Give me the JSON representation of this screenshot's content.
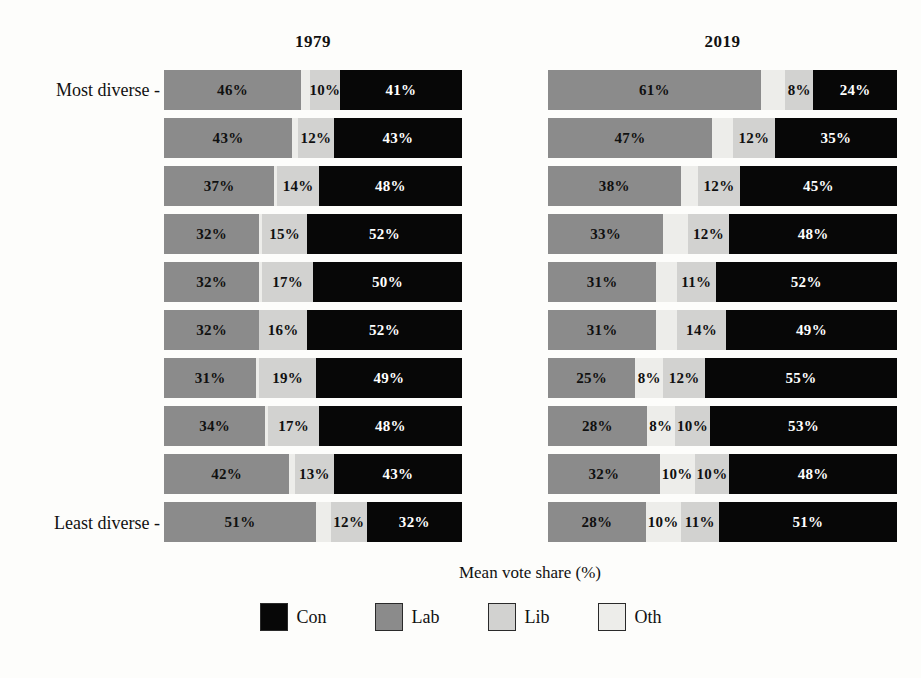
{
  "axis": {
    "xlabel": "Mean vote share (%)",
    "ytick_top": "Most diverse -",
    "ytick_bottom": "Least diverse -"
  },
  "panels": [
    {
      "title": "1979"
    },
    {
      "title": "2019"
    }
  ],
  "legend": {
    "items": [
      {
        "label": "Con",
        "color": "#070707"
      },
      {
        "label": "Lab",
        "color": "#8b8b8b"
      },
      {
        "label": "Lib",
        "color": "#d2d2d0"
      },
      {
        "label": "Oth",
        "color": "#ededea"
      }
    ]
  },
  "chart_data": {
    "type": "bar",
    "title": "",
    "subtitle": "",
    "orientation": "horizontal",
    "stacked": true,
    "xlabel": "Mean vote share (%)",
    "ylabel": "",
    "xlim": [
      0,
      100
    ],
    "grid": false,
    "legend_position": "bottom",
    "categories": [
      "Most diverse",
      "2",
      "3",
      "4",
      "5",
      "6",
      "7",
      "8",
      "9",
      "Least diverse"
    ],
    "segment_order": [
      "Lab",
      "Oth",
      "Lib",
      "Con"
    ],
    "panels": [
      {
        "name": "1979",
        "rows": [
          {
            "Lab": 46,
            "Oth": 3,
            "Lib": 10,
            "Con": 41,
            "labels": {
              "Lab": "46%",
              "Oth": "",
              "Lib": "10%",
              "Con": "41%"
            }
          },
          {
            "Lab": 43,
            "Oth": 2,
            "Lib": 12,
            "Con": 43,
            "labels": {
              "Lab": "43%",
              "Oth": "",
              "Lib": "12%",
              "Con": "43%"
            }
          },
          {
            "Lab": 37,
            "Oth": 1,
            "Lib": 14,
            "Con": 48,
            "labels": {
              "Lab": "37%",
              "Oth": "",
              "Lib": "14%",
              "Con": "48%"
            }
          },
          {
            "Lab": 32,
            "Oth": 1,
            "Lib": 15,
            "Con": 52,
            "labels": {
              "Lab": "32%",
              "Oth": "",
              "Lib": "15%",
              "Con": "52%"
            }
          },
          {
            "Lab": 32,
            "Oth": 1,
            "Lib": 17,
            "Con": 50,
            "labels": {
              "Lab": "32%",
              "Oth": "",
              "Lib": "17%",
              "Con": "50%"
            }
          },
          {
            "Lab": 32,
            "Oth": 0,
            "Lib": 16,
            "Con": 52,
            "labels": {
              "Lab": "32%",
              "Oth": "",
              "Lib": "16%",
              "Con": "52%"
            }
          },
          {
            "Lab": 31,
            "Oth": 1,
            "Lib": 19,
            "Con": 49,
            "labels": {
              "Lab": "31%",
              "Oth": "",
              "Lib": "19%",
              "Con": "49%"
            }
          },
          {
            "Lab": 34,
            "Oth": 1,
            "Lib": 17,
            "Con": 48,
            "labels": {
              "Lab": "34%",
              "Oth": "",
              "Lib": "17%",
              "Con": "48%"
            }
          },
          {
            "Lab": 42,
            "Oth": 2,
            "Lib": 13,
            "Con": 43,
            "labels": {
              "Lab": "42%",
              "Oth": "",
              "Lib": "13%",
              "Con": "43%"
            }
          },
          {
            "Lab": 51,
            "Oth": 5,
            "Lib": 12,
            "Con": 32,
            "labels": {
              "Lab": "51%",
              "Oth": "",
              "Lib": "12%",
              "Con": "32%"
            }
          }
        ]
      },
      {
        "name": "2019",
        "rows": [
          {
            "Lab": 61,
            "Oth": 7,
            "Lib": 8,
            "Con": 24,
            "labels": {
              "Lab": "61%",
              "Oth": "",
              "Lib": "8%",
              "Con": "24%"
            }
          },
          {
            "Lab": 47,
            "Oth": 6,
            "Lib": 12,
            "Con": 35,
            "labels": {
              "Lab": "47%",
              "Oth": "",
              "Lib": "12%",
              "Con": "35%"
            }
          },
          {
            "Lab": 38,
            "Oth": 5,
            "Lib": 12,
            "Con": 45,
            "labels": {
              "Lab": "38%",
              "Oth": "",
              "Lib": "12%",
              "Con": "45%"
            }
          },
          {
            "Lab": 33,
            "Oth": 7,
            "Lib": 12,
            "Con": 48,
            "labels": {
              "Lab": "33%",
              "Oth": "",
              "Lib": "12%",
              "Con": "48%"
            }
          },
          {
            "Lab": 31,
            "Oth": 6,
            "Lib": 11,
            "Con": 52,
            "labels": {
              "Lab": "31%",
              "Oth": "",
              "Lib": "11%",
              "Con": "52%"
            }
          },
          {
            "Lab": 31,
            "Oth": 6,
            "Lib": 14,
            "Con": 49,
            "labels": {
              "Lab": "31%",
              "Oth": "",
              "Lib": "14%",
              "Con": "49%"
            }
          },
          {
            "Lab": 25,
            "Oth": 8,
            "Lib": 12,
            "Con": 55,
            "labels": {
              "Lab": "25%",
              "Oth": "8%",
              "Lib": "12%",
              "Con": "55%"
            }
          },
          {
            "Lab": 28,
            "Oth": 8,
            "Lib": 10,
            "Con": 53,
            "labels": {
              "Lab": "28%",
              "Oth": "8%",
              "Lib": "10%",
              "Con": "53%"
            }
          },
          {
            "Lab": 32,
            "Oth": 10,
            "Lib": 10,
            "Con": 48,
            "labels": {
              "Lab": "32%",
              "Oth": "10%",
              "Lib": "10%",
              "Con": "48%"
            }
          },
          {
            "Lab": 28,
            "Oth": 10,
            "Lib": 11,
            "Con": 51,
            "labels": {
              "Lab": "28%",
              "Oth": "10%",
              "Lib": "11%",
              "Con": "51%"
            }
          }
        ]
      }
    ]
  }
}
